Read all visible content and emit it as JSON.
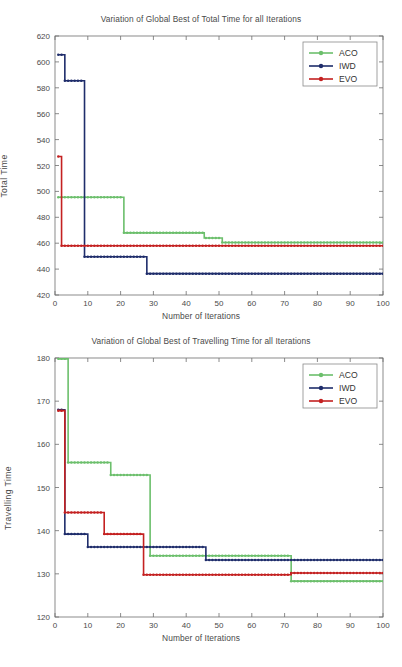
{
  "figures": [
    {
      "id": "total-time",
      "title": "Variation of Global Best of Total Time for all Iterations",
      "xlabel": "Number of Iterations",
      "ylabel": "Total Time"
    },
    {
      "id": "travelling-time",
      "title": "Variation of Global Best of Travelling Time for all Iterations",
      "xlabel": "Number of Iterations",
      "ylabel": "Travelling Time"
    }
  ],
  "legend": {
    "items": [
      {
        "label": "ACO",
        "color": "#6cbf6c"
      },
      {
        "label": "IWD",
        "color": "#1f2d6b"
      },
      {
        "label": "EVO",
        "color": "#c42121"
      }
    ]
  },
  "colors": {
    "aco": "#6cbf6c",
    "iwd": "#1f2d6b",
    "evo": "#c42121",
    "axis": "#6e6e6e",
    "text": "#4a4a4a",
    "background": "#ffffff"
  },
  "footer_text": "",
  "chart_data": [
    {
      "type": "line",
      "title": "Variation of Global Best of Total Time for all Iterations",
      "xlabel": "Number of Iterations",
      "ylabel": "Total Time",
      "xlim": [
        0,
        100
      ],
      "ylim": [
        420,
        620
      ],
      "xticks": [
        0,
        10,
        20,
        30,
        40,
        50,
        60,
        70,
        80,
        90,
        100
      ],
      "yticks": [
        420,
        440,
        460,
        480,
        500,
        520,
        540,
        560,
        580,
        600,
        620
      ],
      "grid": false,
      "legend_position": "upper right",
      "step_style": "post",
      "series": [
        {
          "name": "ACO",
          "color": "#6cbf6c",
          "steps": [
            {
              "x": 1,
              "y": 495.5
            },
            {
              "x": 21,
              "y": 468.0
            },
            {
              "x": 45.5,
              "y": 464.0
            },
            {
              "x": 51,
              "y": 460.5
            },
            {
              "x": 100,
              "y": 460.5
            }
          ]
        },
        {
          "name": "IWD",
          "color": "#1f2d6b",
          "steps": [
            {
              "x": 1,
              "y": 605.5
            },
            {
              "x": 3,
              "y": 585.5
            },
            {
              "x": 9,
              "y": 449.5
            },
            {
              "x": 28,
              "y": 436.5
            },
            {
              "x": 100,
              "y": 436.5
            }
          ]
        },
        {
          "name": "EVO",
          "color": "#c42121",
          "steps": [
            {
              "x": 1,
              "y": 527.0
            },
            {
              "x": 2,
              "y": 458.0
            },
            {
              "x": 100,
              "y": 458.0
            }
          ]
        }
      ]
    },
    {
      "type": "line",
      "title": "Variation of Global Best of Travelling Time for all Iterations",
      "xlabel": "Number of Iterations",
      "ylabel": "Travelling Time",
      "xlim": [
        0,
        100
      ],
      "ylim": [
        120,
        180
      ],
      "xticks": [
        0,
        10,
        20,
        30,
        40,
        50,
        60,
        70,
        80,
        90,
        100
      ],
      "yticks": [
        120,
        130,
        140,
        150,
        160,
        170,
        180
      ],
      "grid": false,
      "legend_position": "upper right",
      "step_style": "post",
      "series": [
        {
          "name": "ACO",
          "color": "#6cbf6c",
          "steps": [
            {
              "x": 1,
              "y": 179.8
            },
            {
              "x": 4,
              "y": 155.8
            },
            {
              "x": 17,
              "y": 152.9
            },
            {
              "x": 29,
              "y": 134.2
            },
            {
              "x": 72,
              "y": 128.3
            },
            {
              "x": 100,
              "y": 128.3
            }
          ]
        },
        {
          "name": "IWD",
          "color": "#1f2d6b",
          "steps": [
            {
              "x": 1,
              "y": 168.0
            },
            {
              "x": 3,
              "y": 139.2
            },
            {
              "x": 10,
              "y": 136.2
            },
            {
              "x": 46,
              "y": 133.2
            },
            {
              "x": 100,
              "y": 133.2
            }
          ]
        },
        {
          "name": "EVO",
          "color": "#c42121",
          "steps": [
            {
              "x": 1,
              "y": 167.8
            },
            {
              "x": 3,
              "y": 144.2
            },
            {
              "x": 15,
              "y": 139.2
            },
            {
              "x": 27,
              "y": 129.8
            },
            {
              "x": 72,
              "y": 130.2
            },
            {
              "x": 100,
              "y": 130.2
            }
          ]
        }
      ]
    }
  ]
}
